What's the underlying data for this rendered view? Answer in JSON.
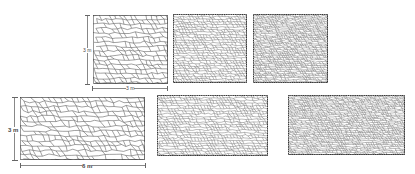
{
  "figure": {
    "colors": {
      "background": "#ffffff",
      "cell_edge": "#555555",
      "border": "#333333",
      "dim_line": "#888888"
    },
    "top_row": {
      "dimension_labels": {
        "height": "3 m",
        "width": "3 m"
      },
      "panels": [
        {
          "id": "a",
          "density": "coarse",
          "cell_size": 5.2
        },
        {
          "id": "b",
          "density": "medium",
          "cell_size": 3.0
        },
        {
          "id": "c",
          "density": "fine",
          "cell_size": 2.3
        }
      ]
    },
    "bottom_row": {
      "dimension_labels": {
        "height": "3 m",
        "width": "6 m"
      },
      "panels": [
        {
          "id": "d",
          "density": "coarse",
          "cell_size": 5.6
        },
        {
          "id": "e",
          "density": "medium",
          "cell_size": 3.1
        },
        {
          "id": "f",
          "density": "fine",
          "cell_size": 2.3
        }
      ]
    }
  }
}
